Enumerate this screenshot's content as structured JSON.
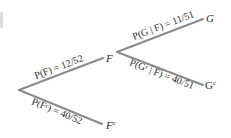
{
  "diagram": {
    "type": "probability-tree",
    "colors": {
      "branch": "#8a8a8a",
      "text": "#2a2a2a",
      "background": "#ffffff"
    },
    "nodes": {
      "root": {
        "label": ""
      },
      "F": {
        "label": "F"
      },
      "Fc": {
        "label": "F",
        "sup": "c"
      },
      "G": {
        "label": "G"
      },
      "Gc": {
        "label": "G",
        "sup": "c"
      }
    },
    "branches": [
      {
        "id": "root-F",
        "from": "root",
        "to": "F",
        "probability": "P(F) = 12/52"
      },
      {
        "id": "root-Fc",
        "from": "root",
        "to": "Fc",
        "probability": "P(Fᶜ) = 40/52"
      },
      {
        "id": "F-G",
        "from": "F",
        "to": "G",
        "probability": "P(G | F) = 11/51"
      },
      {
        "id": "F-Gc",
        "from": "F",
        "to": "Gc",
        "probability": "P(Gᶜ | F) = 40/51"
      }
    ]
  }
}
